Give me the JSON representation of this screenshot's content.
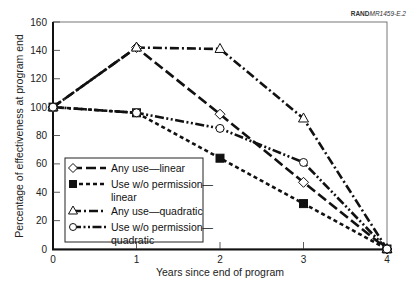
{
  "source_tag": {
    "bold": "RAND",
    "rest": "MR1459-E.2"
  },
  "chart_data": {
    "type": "line",
    "title": "",
    "xlabel": "Years since end of program",
    "ylabel": "Percentage of effectiveness at program end",
    "x": [
      0,
      1,
      2,
      3,
      4
    ],
    "xlim": [
      0,
      4
    ],
    "ylim": [
      0,
      160
    ],
    "xticks": [
      "0",
      "1",
      "2",
      "3",
      "4"
    ],
    "yticks": [
      "0",
      "20",
      "40",
      "60",
      "80",
      "100",
      "120",
      "140",
      "160"
    ],
    "grid": false,
    "legend_position": "lower-left inside",
    "series": [
      {
        "name": "Any use—linear",
        "marker": "open-diamond",
        "line": "long-dash",
        "values": [
          100,
          142,
          95,
          47,
          0
        ]
      },
      {
        "name": "Use w/o permission—linear",
        "marker": "filled-square",
        "line": "short-dash",
        "values": [
          100,
          96,
          64,
          32,
          0
        ]
      },
      {
        "name": "Any use—quadratic",
        "marker": "open-triangle",
        "line": "dash-dot",
        "values": [
          100,
          142,
          141,
          92,
          0
        ]
      },
      {
        "name": "Use w/o permission—quadratic",
        "marker": "open-circle",
        "line": "dash-dot-dot",
        "values": [
          100,
          96,
          85,
          61,
          0
        ]
      }
    ]
  },
  "legend": {
    "items": [
      {
        "line1": "Any use—linear",
        "line2": ""
      },
      {
        "line1": "Use w/o permission—",
        "line2": "linear"
      },
      {
        "line1": "Any use—quadratic",
        "line2": ""
      },
      {
        "line1": "Use w/o permission—",
        "line2": "quadratic"
      }
    ]
  }
}
